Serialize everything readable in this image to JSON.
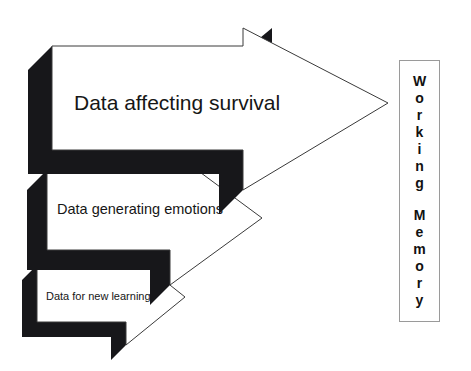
{
  "diagram": {
    "background_color": "#ffffff",
    "arrow_fill_color": "#ffffff",
    "arrow_outline_color": "#3a3a3a",
    "arrow_shadow_color": "#17171a",
    "text_color": "#161616",
    "arrows": [
      {
        "id": "arrow-survival",
        "label": "Data affecting survival",
        "size": "large",
        "label_x": 170,
        "label_y": 104
      },
      {
        "id": "arrow-emotions",
        "label": "Data generating emotions",
        "size": "medium",
        "label_x": 154,
        "label_y": 210
      },
      {
        "id": "arrow-learning",
        "label": "Data for new learning",
        "size": "small",
        "label_x": 110,
        "label_y": 297
      }
    ]
  },
  "working_memory": {
    "border_color": "#9a9a9a",
    "words": [
      {
        "text": "Working",
        "letters": [
          "W",
          "o",
          "r",
          "k",
          "i",
          "n",
          "g"
        ]
      },
      {
        "text": "Memory",
        "letters": [
          "M",
          "e",
          "m",
          "o",
          "r",
          "y"
        ]
      }
    ]
  }
}
